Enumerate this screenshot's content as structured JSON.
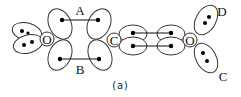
{
  "diagram": {
    "type": "orbital-bonding-diagram",
    "atoms": [
      {
        "id": "O1",
        "symbol": "O"
      },
      {
        "id": "C1",
        "symbol": "C"
      },
      {
        "id": "O2",
        "symbol": "O"
      }
    ],
    "bond_labels": {
      "A": "A",
      "B": "B",
      "C": "C",
      "D": "D"
    },
    "caption": "(a)"
  }
}
